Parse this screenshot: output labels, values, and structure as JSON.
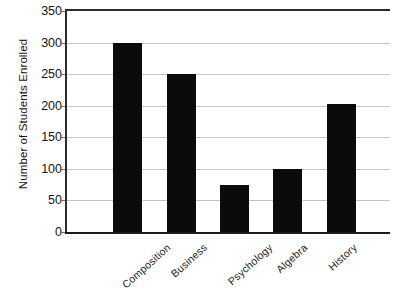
{
  "chart_data": {
    "type": "bar",
    "title": "",
    "xlabel": "",
    "ylabel": "Number of Students Enrolled",
    "categories": [
      "Composition",
      "Business",
      "Psychology",
      "Algebra",
      "History"
    ],
    "values": [
      300,
      250,
      75,
      100,
      203
    ],
    "ylim": [
      0,
      350
    ],
    "yticks": [
      0,
      50,
      100,
      150,
      200,
      250,
      300,
      350
    ],
    "ytick_labels": [
      "0",
      "50",
      "100",
      "150",
      "200",
      "250",
      "300",
      "350"
    ],
    "grid": true,
    "legend": "none",
    "bar_color": "#0b0b0b",
    "grid_color": "#c4c4c4",
    "axis_color": "#2b2b2b",
    "background_color": "#ffffff"
  },
  "axis": {
    "y_title": "Number of Students Enrolled"
  }
}
